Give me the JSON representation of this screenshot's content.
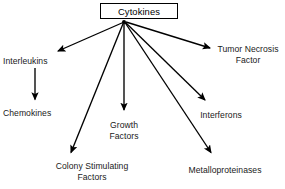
{
  "diagram": {
    "title": "Cytokines",
    "type": "radial-hierarchy",
    "background_color": "#ffffff",
    "line_color": "#000000",
    "text_color": "#1a1a1a",
    "root": {
      "label": "Cytokines",
      "boxed": true
    },
    "branches": [
      {
        "id": "interleukins",
        "label": "Interleukins",
        "lines": [
          "Interleukins"
        ],
        "align": "left"
      },
      {
        "id": "chemokines",
        "label": "Chemokines",
        "lines": [
          "Chemokines"
        ],
        "align": "left"
      },
      {
        "id": "colony-stimulating-factors",
        "label": "Colony Stimulating Factors",
        "lines": [
          "Colony Stimulating",
          "Factors"
        ],
        "align": "center"
      },
      {
        "id": "growth-factors",
        "label": "Growth Factors",
        "lines": [
          "Growth",
          "Factors"
        ],
        "align": "center"
      },
      {
        "id": "metalloproteinases",
        "label": "Metalloproteinases",
        "lines": [
          "Metalloproteinases"
        ],
        "align": "center"
      },
      {
        "id": "interferons",
        "label": "Interferons",
        "lines": [
          "Interferons"
        ],
        "align": "center"
      },
      {
        "id": "tumor-necrosis-factor",
        "label": "Tumor Necrosis Factor",
        "lines": [
          "Tumor Necrosis",
          "Factor"
        ],
        "align": "center"
      }
    ],
    "connections": [
      {
        "from": "Cytokines",
        "to": "Interleukins"
      },
      {
        "from": "Cytokines",
        "to": "Tumor Necrosis Factor"
      },
      {
        "from": "Cytokines",
        "to": "Interferons"
      },
      {
        "from": "Cytokines",
        "to": "Growth Factors"
      },
      {
        "from": "Cytokines",
        "to": "Metalloproteinases"
      },
      {
        "from": "Cytokines",
        "to": "Colony Stimulating Factors"
      },
      {
        "from": "Interleukins",
        "to": "Chemokines"
      }
    ]
  }
}
